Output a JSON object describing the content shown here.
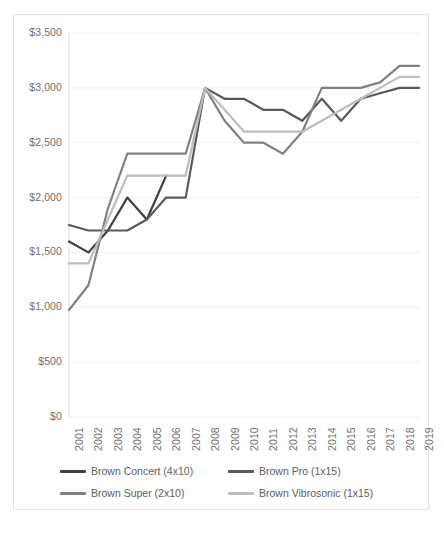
{
  "chart_data": {
    "type": "line",
    "title": "",
    "xlabel": "",
    "ylabel": "",
    "grid": "horizontal",
    "legend_position": "bottom",
    "ylim": [
      0,
      3500
    ],
    "ytick_labels": [
      "$0",
      "$500",
      "$1,000",
      "$1,500",
      "$2,000",
      "$2,500",
      "$3,000",
      "$3,500"
    ],
    "ytick_values": [
      0,
      500,
      1000,
      1500,
      2000,
      2500,
      3000,
      3500
    ],
    "categories": [
      "2001",
      "2002",
      "2003",
      "2004",
      "2005",
      "2006",
      "2007",
      "2008",
      "2009",
      "2010",
      "2011",
      "2012",
      "2013",
      "2014",
      "2015",
      "2016",
      "2017",
      "2018",
      "2019"
    ],
    "series": [
      {
        "name": "Brown Concert (4x10)",
        "color": "#3f3f3f",
        "values": [
          1600,
          1500,
          1700,
          2000,
          1800,
          2200,
          null,
          null,
          null,
          null,
          null,
          null,
          null,
          null,
          null,
          null,
          null,
          null,
          null
        ]
      },
      {
        "name": "Brown Pro (1x15)",
        "color": "#595959",
        "values": [
          1750,
          1700,
          1700,
          1700,
          1800,
          2000,
          2000,
          3000,
          2900,
          2900,
          2800,
          2800,
          2700,
          2900,
          2700,
          2900,
          2950,
          3000,
          3000
        ]
      },
      {
        "name": "Brown Super (2x10)",
        "color": "#808080",
        "values": [
          975,
          1200,
          1900,
          2400,
          2400,
          2400,
          2400,
          3000,
          2700,
          2500,
          2500,
          2400,
          2600,
          3000,
          3000,
          3000,
          3050,
          3200,
          3200
        ]
      },
      {
        "name": "Brown Vibrosonic (1x15)",
        "color": "#bcbcbc",
        "values": [
          1400,
          1400,
          1800,
          2200,
          2200,
          2200,
          2200,
          3000,
          2800,
          2600,
          2600,
          2600,
          2600,
          2700,
          2800,
          2900,
          3000,
          3100,
          3100
        ]
      }
    ]
  }
}
